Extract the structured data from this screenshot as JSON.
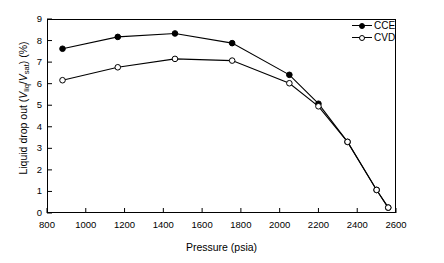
{
  "chart_data": {
    "type": "line",
    "title": "",
    "xlabel": "Pressure (psia)",
    "ylabel": "Liquid drop out (Vliq/Vsat) (%)",
    "ylabel_parts": {
      "prefix": "Liquid drop out (",
      "v1": "V",
      "sub1": "liq",
      "slash": "/",
      "v2": "V",
      "sub2": "sat",
      "suffix": ") (%)"
    },
    "xlim": [
      800,
      2600
    ],
    "ylim": [
      0,
      9
    ],
    "xticks": [
      800,
      1000,
      1200,
      1400,
      1600,
      1800,
      2000,
      2200,
      2400,
      2600
    ],
    "yticks": [
      0,
      1,
      2,
      3,
      4,
      5,
      6,
      7,
      8,
      9
    ],
    "grid": false,
    "legend_position": "top-right-inside",
    "series": [
      {
        "name": "CCE",
        "marker": "filled-circle",
        "color": "#000000",
        "x": [
          880,
          1165,
          1460,
          1755,
          2050,
          2200,
          2350,
          2500,
          2560
        ],
        "values": [
          7.62,
          8.17,
          8.33,
          7.88,
          6.41,
          5.07,
          3.3,
          1.07,
          0.25
        ]
      },
      {
        "name": "CVD",
        "marker": "open-circle",
        "color": "#000000",
        "x": [
          880,
          1165,
          1460,
          1755,
          2050,
          2200,
          2350,
          2500,
          2560
        ],
        "values": [
          6.16,
          6.76,
          7.15,
          7.07,
          6.02,
          4.95,
          3.3,
          1.07,
          0.25
        ]
      }
    ]
  },
  "legend": {
    "items": [
      {
        "label": "CCE",
        "marker": "filled-circle"
      },
      {
        "label": "CVD",
        "marker": "open-circle"
      }
    ]
  }
}
